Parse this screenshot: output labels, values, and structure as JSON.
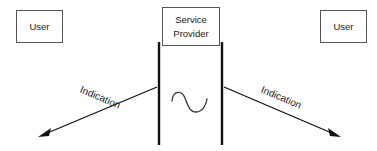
{
  "diagram": {
    "background_color": "#ffffff",
    "line_color": "#111111",
    "box_border_color": "#555555",
    "text_color": "#1a1a1a",
    "nodes": {
      "left_user": {
        "label": "User",
        "x": 16,
        "y": 10,
        "width": 46,
        "height": 32
      },
      "right_user": {
        "label": "User",
        "x": 320,
        "y": 10,
        "width": 47,
        "height": 32
      },
      "service_provider": {
        "label_line1": "Service",
        "label_line2": "Provider",
        "x": 162,
        "y": 7,
        "width": 58,
        "height": 39
      }
    },
    "boundaries": {
      "left_bar": {
        "x": 159,
        "y_top": 42,
        "y_bottom": 145
      },
      "right_bar": {
        "x": 222,
        "y_top": 42,
        "y_bottom": 145
      }
    },
    "signal": {
      "name": "sine-wave-squiggle",
      "x_start": 172,
      "x_end": 207,
      "y_top": 92,
      "y_bottom": 112
    },
    "arrows": [
      {
        "name": "left-indication-arrow",
        "label": "Indication",
        "direction": "down-left",
        "from_x": 157,
        "from_y": 87,
        "to_x": 38,
        "to_y": 137,
        "label_rotation_deg": 23
      },
      {
        "name": "right-indication-arrow",
        "label": "Indication",
        "direction": "down-right",
        "from_x": 224,
        "from_y": 87,
        "to_x": 341,
        "to_y": 137,
        "label_rotation_deg": 23
      }
    ]
  }
}
